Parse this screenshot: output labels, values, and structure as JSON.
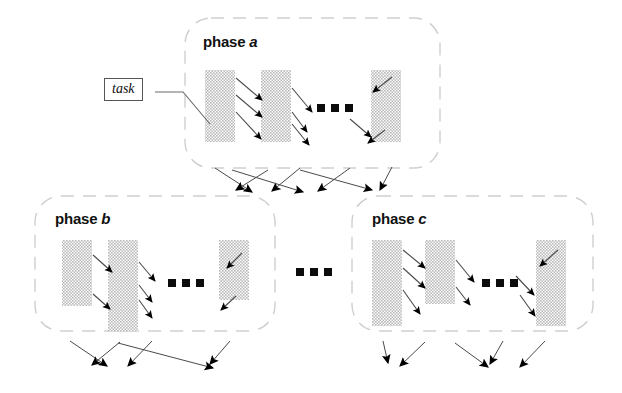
{
  "figure": {
    "type": "diagram",
    "subtype": "phase-task-dependency-graph",
    "background_color": "#ffffff",
    "bar_fill_color": "#c9c9c9",
    "bar_pattern": "halftone-checker",
    "line_color": "#4a4a4a",
    "arrow_color": "#000000",
    "dash_border_color": "#cccccc"
  },
  "annotations": {
    "task_label": {
      "text": "task",
      "style": "italic-serif-boxed"
    }
  },
  "phases": [
    {
      "id": "phase-a",
      "label_prefix": "phase",
      "label_letter": "a",
      "box": {
        "x": 185,
        "y": 18,
        "w": 255,
        "h": 150
      },
      "bars": [
        {
          "x": 205,
          "y": 70,
          "w": 30,
          "h": 72
        },
        {
          "x": 261,
          "y": 70,
          "w": 30,
          "h": 72
        },
        {
          "x": 371,
          "y": 70,
          "w": 30,
          "h": 72
        }
      ],
      "ellipsis": {
        "x": 317,
        "y": 108,
        "dots": 3
      },
      "internal_arrows": 7
    },
    {
      "id": "phase-b",
      "label_prefix": "phase",
      "label_letter": "b",
      "box": {
        "x": 35,
        "y": 196,
        "w": 240,
        "h": 135
      },
      "bars": [
        {
          "x": 62,
          "y": 240,
          "w": 30,
          "h": 66
        },
        {
          "x": 108,
          "y": 240,
          "w": 30,
          "h": 92
        },
        {
          "x": 219,
          "y": 240,
          "w": 30,
          "h": 60
        }
      ],
      "ellipsis": {
        "x": 168,
        "y": 283,
        "dots": 3
      },
      "internal_arrows": 7
    },
    {
      "id": "phase-c",
      "label_prefix": "phase",
      "label_letter": "c",
      "box": {
        "x": 352,
        "y": 196,
        "w": 241,
        "h": 135
      },
      "bars": [
        {
          "x": 372,
          "y": 240,
          "w": 30,
          "h": 86
        },
        {
          "x": 425,
          "y": 240,
          "w": 30,
          "h": 64
        },
        {
          "x": 536,
          "y": 240,
          "w": 30,
          "h": 86
        }
      ],
      "ellipsis": {
        "x": 482,
        "y": 283,
        "dots": 3
      },
      "internal_arrows": 7
    }
  ],
  "inter_phase_ellipsis": {
    "x": 296,
    "y": 272,
    "dots": 3
  },
  "connectors": {
    "below_phase_a": {
      "arrow_count": 7,
      "crossing": true
    },
    "below_phase_b": {
      "arrow_count": 5,
      "crossing": true
    },
    "below_phase_c": {
      "arrow_count": 5,
      "crossing": true
    }
  }
}
